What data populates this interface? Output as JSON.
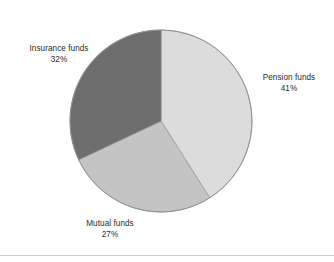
{
  "chart_data": {
    "type": "pie",
    "title": "",
    "subtitle": "",
    "xlabel": "",
    "ylabel": "",
    "legend_position": "none",
    "grid": false,
    "start_angle_deg": 0,
    "direction": "clockwise",
    "categories": [
      "Pension funds",
      "Mutual funds",
      "Insurance funds"
    ],
    "values": [
      41,
      27,
      32
    ],
    "unit": "%",
    "slices": [
      {
        "label": "Pension funds",
        "value": 41,
        "value_label": "41%",
        "color": "#dcdcdc",
        "start_deg": 0,
        "end_deg": 147.6,
        "label_position": "right"
      },
      {
        "label": "Mutual funds",
        "value": 27,
        "value_label": "27%",
        "color": "#c4c4c4",
        "start_deg": 147.6,
        "end_deg": 244.8,
        "label_position": "bottom-left"
      },
      {
        "label": "Insurance funds",
        "value": 32,
        "value_label": "32%",
        "color": "#6e6e6e",
        "start_deg": 244.8,
        "end_deg": 360,
        "label_position": "top-left"
      }
    ]
  },
  "figure": {
    "background_color": "#ffffff",
    "outline_color": "#8e8e8e",
    "divider_color": "#c9cdd2"
  },
  "labels": {
    "insurance": {
      "name": "Insurance funds",
      "value": "32%"
    },
    "pension": {
      "name": "Pension funds",
      "value": "41%"
    },
    "mutual": {
      "name": "Mutual funds",
      "value": "27%"
    }
  }
}
